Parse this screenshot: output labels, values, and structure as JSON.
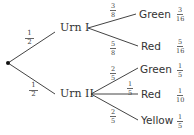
{
  "diagram": {
    "type": "probability-tree",
    "root": {
      "label": ""
    },
    "level1": [
      {
        "label": "Urn I",
        "branch_prob": {
          "num": "1",
          "den": "2"
        },
        "outcomes": [
          {
            "label": "Green",
            "branch_prob": {
              "num": "3",
              "den": "8"
            },
            "joint_prob": {
              "num": "3",
              "den": "16"
            }
          },
          {
            "label": "Red",
            "branch_prob": {
              "num": "5",
              "den": "8"
            },
            "joint_prob": {
              "num": "5",
              "den": "16"
            }
          }
        ]
      },
      {
        "label": "Urn II",
        "branch_prob": {
          "num": "1",
          "den": "2"
        },
        "outcomes": [
          {
            "label": "Green",
            "branch_prob": {
              "num": "2",
              "den": "5"
            },
            "joint_prob": {
              "num": "1",
              "den": "5"
            }
          },
          {
            "label": "Red",
            "branch_prob": {
              "num": "1",
              "den": "5"
            },
            "joint_prob": {
              "num": "1",
              "den": "10"
            }
          },
          {
            "label": "Yellow",
            "branch_prob": {
              "num": "2",
              "den": "5"
            },
            "joint_prob": {
              "num": "1",
              "den": "5"
            }
          }
        ]
      }
    ]
  }
}
